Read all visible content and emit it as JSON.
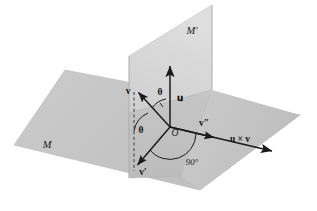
{
  "figure": {
    "background_color": "#ffffff",
    "plane_fill": "#c9c9c9",
    "plane_fill_light": "#d8d8d8",
    "plane_edge": "#b4b4b4",
    "vector_color": "#1a1a1a"
  },
  "planes": [
    {
      "id": "M",
      "label": "M",
      "label_x": 47,
      "label_y": 148,
      "description": "horizontal plane"
    },
    {
      "id": "Mp",
      "label": "M′",
      "label_x": 192,
      "label_y": 34,
      "description": "vertical plane"
    }
  ],
  "origin": {
    "label": "O",
    "x": 175,
    "y": 134
  },
  "vectors": [
    {
      "id": "u",
      "label": "𝐮",
      "label_text": "u",
      "label_x": 179,
      "label_y": 99,
      "from": [
        170,
        127
      ],
      "to": [
        170,
        64
      ]
    },
    {
      "id": "v",
      "label": "v",
      "label_text": "v",
      "label_x": 129,
      "label_y": 94,
      "from": [
        170,
        127
      ],
      "to": [
        137,
        91
      ]
    },
    {
      "id": "vprime",
      "label": "v′",
      "label_text": "v'",
      "label_x": 143,
      "label_y": 174,
      "from": [
        170,
        127
      ],
      "to": [
        136,
        167
      ]
    },
    {
      "id": "vdblprime",
      "label": "v″",
      "label_text": "v''",
      "label_x": 203,
      "label_y": 126,
      "from": [
        170,
        127
      ],
      "to": [
        216,
        138
      ]
    },
    {
      "id": "ucrossv",
      "label": "u × v",
      "label_text": "u x v",
      "label_x": 237,
      "label_y": 141,
      "from": [
        170,
        127
      ],
      "to": [
        274,
        152
      ]
    }
  ],
  "angles": [
    {
      "id": "theta-upper",
      "label": "θ",
      "label_x": 159,
      "label_y": 94,
      "description": "angle between v and u"
    },
    {
      "id": "theta-lower",
      "label": "θ",
      "label_x": 140,
      "label_y": 131,
      "description": "angle between dashed normal and v-prime"
    },
    {
      "id": "right-angle",
      "label": "90°",
      "label_x": 191,
      "label_y": 163,
      "description": "right angle between v-prime and v-double-prime"
    }
  ],
  "guides": [
    {
      "id": "dashed-normal",
      "style": "dashed",
      "from": [
        134,
        91
      ],
      "to": [
        134,
        170
      ]
    }
  ]
}
